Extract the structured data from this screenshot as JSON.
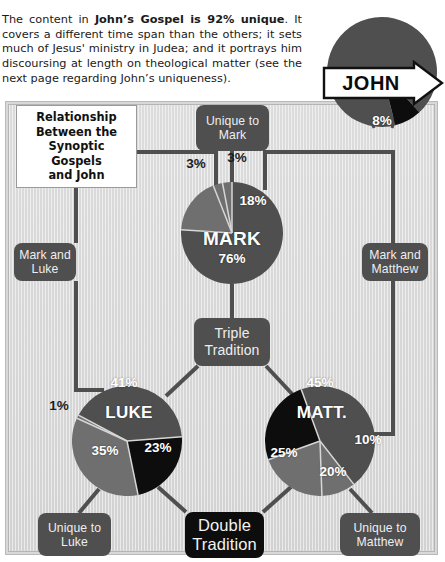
{
  "intro": {
    "segments": [
      {
        "text": "The content in ",
        "bold": false
      },
      {
        "text": "John’s Gospel is 92% unique",
        "bold": true
      },
      {
        "text": ". It covers a different time span than the others; it sets much of Jesus' ministry in Judea; and it portrays him discoursing at length on theological matter (see the next page regarding John’s uniqueness).",
        "bold": false
      }
    ],
    "plain": "The content in John’s Gospel is 92% unique. It covers a different time span than the others; it sets much of Jesus' ministry in Judea; and it portrays him discoursing at length on theological matter (see the next page regarding John’s uniqueness)."
  },
  "title_card": {
    "lines": [
      "Relationship",
      "Between the",
      "Synoptic",
      "Gospels",
      "and John"
    ],
    "text": "Relationship Between the Synoptic Gospels and John"
  },
  "banner": {
    "label": "JOHN"
  },
  "chips": {
    "unique_to_mark": "Unique to Mark",
    "mark_and_luke": "Mark and Luke",
    "mark_and_matthew": "Mark and Matthew",
    "triple_tradition": "Triple Tradition",
    "double_tradition": "Double Tradition",
    "unique_to_luke": "Unique to Luke",
    "unique_to_matthew": "Unique to Matthew"
  },
  "colors": {
    "dark_gray": "#4f4f4f",
    "mid_gray": "#6f6f6f",
    "black": "#0d0d0d",
    "panel_bg": "#d6d6d6",
    "wire": "#4f4f4f",
    "white": "#ffffff"
  },
  "chart_data": [
    {
      "type": "pie",
      "title": "JOHN",
      "name_label": "JOHN",
      "categories": [
        "Unique to John",
        "Shared"
      ],
      "values": [
        92,
        8
      ],
      "labels": [
        "",
        "8%"
      ],
      "colors": [
        "#4f4f4f",
        "#0d0d0d"
      ],
      "center": [
        382,
        72
      ],
      "radius": 55
    },
    {
      "type": "pie",
      "title": "MARK",
      "name_label": "MARK",
      "categories": [
        "Triple Tradition",
        "Mark and Matthew",
        "Mark and Luke",
        "Unique to Mark"
      ],
      "values": [
        76,
        18,
        3,
        3
      ],
      "labels": [
        "76%",
        "18%",
        "3%",
        "3%"
      ],
      "colors": [
        "#4f4f4f",
        "#6f6f6f",
        "#6f6f6f",
        "#6f6f6f"
      ],
      "center": [
        232,
        233
      ],
      "radius": 51
    },
    {
      "type": "pie",
      "title": "LUKE",
      "name_label": "LUKE",
      "categories": [
        "Triple Tradition",
        "Double Tradition",
        "Unique to Luke",
        "Mark and Luke"
      ],
      "values": [
        41,
        23,
        35,
        1
      ],
      "labels": [
        "41%",
        "23%",
        "35%",
        "1%"
      ],
      "colors": [
        "#4f4f4f",
        "#0d0d0d",
        "#6f6f6f",
        "#6f6f6f"
      ],
      "center": [
        127,
        441
      ],
      "radius": 55
    },
    {
      "type": "pie",
      "title": "MATT.",
      "name_label": "MATT.",
      "categories": [
        "Triple Tradition",
        "Mark and Matthew",
        "Unique to Matthew",
        "Double Tradition"
      ],
      "values": [
        45,
        10,
        20,
        25
      ],
      "labels": [
        "45%",
        "10%",
        "20%",
        "25%"
      ],
      "colors": [
        "#4f4f4f",
        "#6f6f6f",
        "#6f6f6f",
        "#0d0d0d"
      ],
      "center": [
        320,
        441
      ],
      "radius": 55
    }
  ],
  "pie_percent_labels": {
    "john_8": "8%",
    "mark_3_left": "3%",
    "mark_3_right": "3%",
    "mark_18": "18%",
    "mark_76": "76%",
    "mark_name": "MARK",
    "luke_41": "41%",
    "luke_23": "23%",
    "luke_35": "35%",
    "luke_1": "1%",
    "luke_name": "LUKE",
    "matt_45": "45%",
    "matt_10": "10%",
    "matt_20": "20%",
    "matt_25": "25%",
    "matt_name": "MATT."
  }
}
